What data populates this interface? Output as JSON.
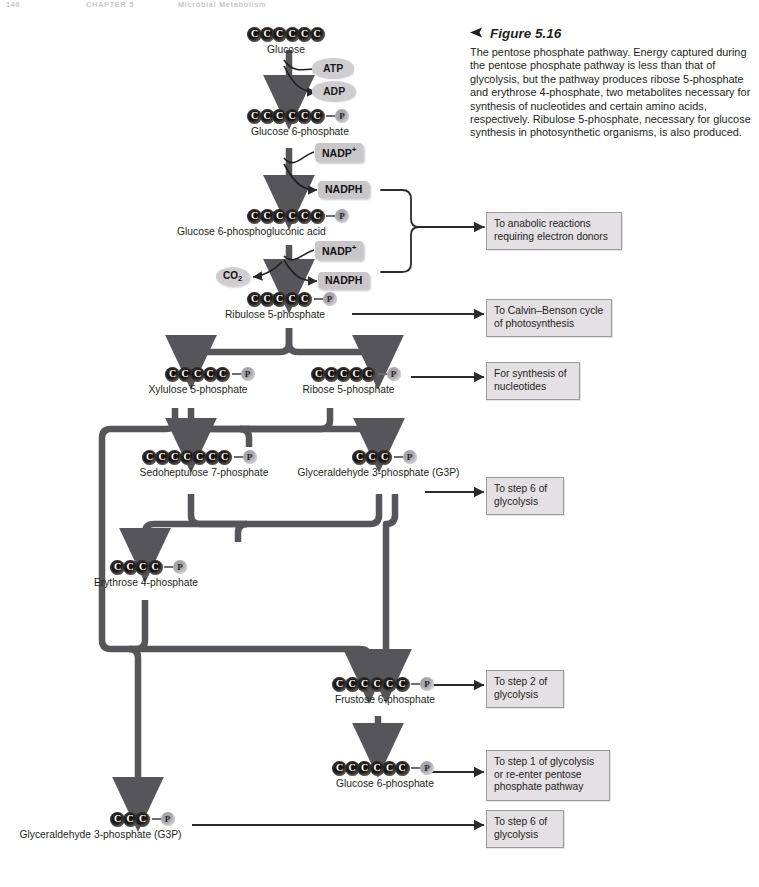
{
  "runhead": {
    "page": "146",
    "chapter": "CHAPTER 5",
    "title": "Microbial Metabolism"
  },
  "caption": {
    "arrow_icon": "left-triangle-icon",
    "figure_label": "Figure 5.16",
    "body": "The pentose phosphate pathway. Energy captured during the pentose phosphate pathway is less than that of glycolysis, but the pathway produces ribose 5-phosphate and erythrose 4-phosphate, two metabolites necessary for synthesis of nucleotides and certain amino acids, respectively. Ribulose 5-phosphate, necessary for glucose synthesis in photosynthetic organisms, is also produced."
  },
  "colors": {
    "carbon": "#15120f",
    "phosphate": "#a6a4a8",
    "cofactor_box": "#c8c6c9",
    "note_box": "#e3e1e3",
    "note_border": "#9b999c",
    "arrow": "#4a4a4c",
    "text": "#231f20"
  },
  "carbon_symbol": "C",
  "phosphate_symbol": "P",
  "molecules": [
    {
      "id": "glucose",
      "label": "Glucose",
      "carbons": 6,
      "phosphate": false
    },
    {
      "id": "g6p_top",
      "label": "Glucose 6-phosphate",
      "carbons": 6,
      "phosphate": true
    },
    {
      "id": "g6pg_acid",
      "label": "Glucose 6-phosphogluconic acid",
      "carbons": 6,
      "phosphate": true
    },
    {
      "id": "ribulose5p",
      "label": "Ribulose 5-phosphate",
      "carbons": 5,
      "phosphate": true
    },
    {
      "id": "xylulose5p",
      "label": "Xylulose 5-phosphate",
      "carbons": 5,
      "phosphate": true
    },
    {
      "id": "ribose5p",
      "label": "Ribose 5-phosphate",
      "carbons": 5,
      "phosphate": true
    },
    {
      "id": "sedoheptulose7p",
      "label": "Sedoheptulose 7-phosphate",
      "carbons": 7,
      "phosphate": true
    },
    {
      "id": "g3p_mid",
      "label": "Glyceraldehyde 3-phosphate (G3P)",
      "carbons": 3,
      "phosphate": true
    },
    {
      "id": "erythrose4p",
      "label": "Erythrose 4-phosphate",
      "carbons": 4,
      "phosphate": true
    },
    {
      "id": "fructose6p",
      "label": "Frustose 6-phosphate",
      "carbons": 6,
      "phosphate": true
    },
    {
      "id": "g6p_bottom",
      "label": "Glucose 6-phosphate",
      "carbons": 6,
      "phosphate": true
    },
    {
      "id": "g3p_bottom",
      "label": "Glyceraldehyde 3-phosphate (G3P)",
      "carbons": 3,
      "phosphate": true
    }
  ],
  "cofactors": {
    "atp": "ATP",
    "adp": "ADP",
    "nadp_plus_1": "NADP",
    "nadp_plus_1_sup": "+",
    "nadph_1": "NADPH",
    "nadp_plus_2": "NADP",
    "nadp_plus_2_sup": "+",
    "nadph_2": "NADPH",
    "co2": "CO",
    "co2_sub": "2"
  },
  "notes": [
    {
      "id": "anabolic",
      "line1": "To anabolic reactions",
      "line2": "requiring electron donors",
      "line3": ""
    },
    {
      "id": "calvin",
      "line1": "To Calvin–Benson cycle",
      "line2": "of photosynthesis",
      "line3": ""
    },
    {
      "id": "nucleotide",
      "line1": "For synthesis of",
      "line2": "nucleotides",
      "line3": ""
    },
    {
      "id": "step6_mid",
      "line1": "To step 6 of",
      "line2": "glycolysis",
      "line3": ""
    },
    {
      "id": "step2",
      "line1": "To step 2 of",
      "line2": "glycolysis",
      "line3": ""
    },
    {
      "id": "step1",
      "line1": "To step 1 of glycolysis",
      "line2": "or re-enter pentose",
      "line3": "phosphate pathway"
    },
    {
      "id": "step6_bot",
      "line1": "To step 6 of",
      "line2": "glycolysis",
      "line3": ""
    }
  ]
}
